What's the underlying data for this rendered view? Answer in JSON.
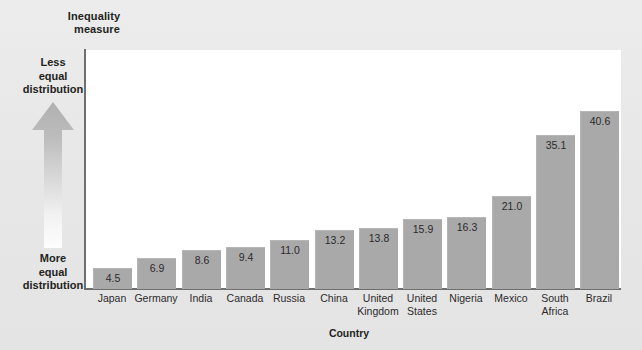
{
  "chart_data": {
    "type": "bar",
    "title": "Inequality measure",
    "xlabel": "Country",
    "ylabel": "Inequality measure",
    "categories": [
      "Japan",
      "Germany",
      "India",
      "Canada",
      "Russia",
      "China",
      "United Kingdom",
      "United States",
      "Nigeria",
      "Mexico",
      "South Africa",
      "Brazil"
    ],
    "values": [
      4.5,
      6.9,
      8.6,
      9.4,
      11.0,
      13.2,
      13.8,
      15.9,
      16.3,
      21.0,
      35.1,
      40.6
    ],
    "value_labels": [
      "4.5",
      "6.9",
      "8.6",
      "9.4",
      "11.0",
      "13.2",
      "13.8",
      "15.9",
      "16.3",
      "21.0",
      "35.1",
      "40.6"
    ],
    "ylim": [
      0,
      54.8
    ],
    "grid": false,
    "legend": null,
    "bar_color": "#a9a9a9",
    "plot_background": "#ffffff",
    "figure_background": "#e9e9e9",
    "axis_color": "#6f6f6f",
    "annotations": {
      "axis_direction_top": "Less equal distribution",
      "axis_direction_bottom": "More equal distribution"
    }
  },
  "labels": {
    "y_axis_title_line1": "Inequality",
    "y_axis_title_line2": "measure",
    "less_equal": [
      "Less",
      "equal",
      "distribution"
    ],
    "more_equal": [
      "More",
      "equal",
      "distribution"
    ],
    "x_axis_title": "Country"
  },
  "category_label_lines": [
    [
      "Japan"
    ],
    [
      "Germany"
    ],
    [
      "India"
    ],
    [
      "Canada"
    ],
    [
      "Russia"
    ],
    [
      "China"
    ],
    [
      "United",
      "Kingdom"
    ],
    [
      "United",
      "States"
    ],
    [
      "Nigeria"
    ],
    [
      "Mexico"
    ],
    [
      "South",
      "Africa"
    ],
    [
      "Brazil"
    ]
  ]
}
